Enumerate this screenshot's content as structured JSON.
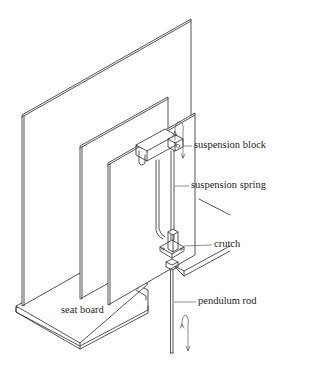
{
  "figure": {
    "type": "technical-illustration",
    "line_color": "#2a2a2a",
    "background": "#ffffff"
  },
  "labels": {
    "suspension_block": "suspension block",
    "suspension_spring": "suspension spring",
    "crutch": "crutch",
    "pendulum_rod": "pendulum rod",
    "seat_board": "seat board"
  },
  "icons": {
    "swing_arrow_top": "curved-arrow-icon",
    "swing_arrow_bottom": "curved-arrow-icon"
  }
}
